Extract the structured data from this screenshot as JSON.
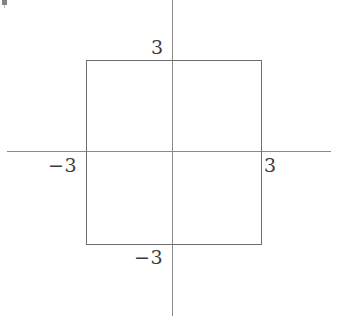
{
  "figure": {
    "title": ""
  },
  "axes": {
    "horizontal_name": "x-axis",
    "vertical_name": "y-axis",
    "color": "#8a8a8a",
    "origin_label": ""
  },
  "ticks": {
    "top": "3",
    "left": "−3",
    "right": "3",
    "bottom": "−3"
  },
  "shape": {
    "kind": "square",
    "color": "#6e6e6e"
  },
  "chart_data": {
    "type": "line",
    "title": "",
    "xlabel": "",
    "ylabel": "",
    "xlim": [
      -5.4,
      5.4
    ],
    "ylim": [
      -4.6,
      4.6
    ],
    "grid": false,
    "legend": "none",
    "xticks": [
      -3,
      3
    ],
    "xticklabels": [
      "−3",
      "3"
    ],
    "yticks": [
      -3,
      3
    ],
    "yticklabels": [
      "−3",
      "3"
    ],
    "series": [
      {
        "name": "square |x|+... boundary",
        "closed": true,
        "x": [
          -3,
          3,
          3,
          -3,
          -3
        ],
        "y": [
          3,
          3,
          -3,
          -3,
          3
        ]
      }
    ],
    "annotations": []
  }
}
